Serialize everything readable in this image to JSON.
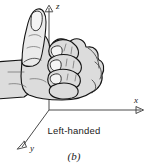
{
  "figure": {
    "subfigure_label": "(b)",
    "caption": "Left-handed",
    "illustration": "left-hand-thumbs-up",
    "colors": {
      "background": "#ffffff",
      "hand_fill": "#dcdcdc",
      "hand_outline": "#141414",
      "axis": "#4a4a4a",
      "text": "#1a1a1a"
    }
  },
  "axes": {
    "z": {
      "label": "z",
      "direction": "up",
      "arrow": true
    },
    "x": {
      "label": "x",
      "direction": "right",
      "arrow": true
    },
    "y": {
      "label": "y",
      "direction": "down-left",
      "arrow": true
    },
    "origin": {
      "x": 49,
      "y": 110
    }
  }
}
